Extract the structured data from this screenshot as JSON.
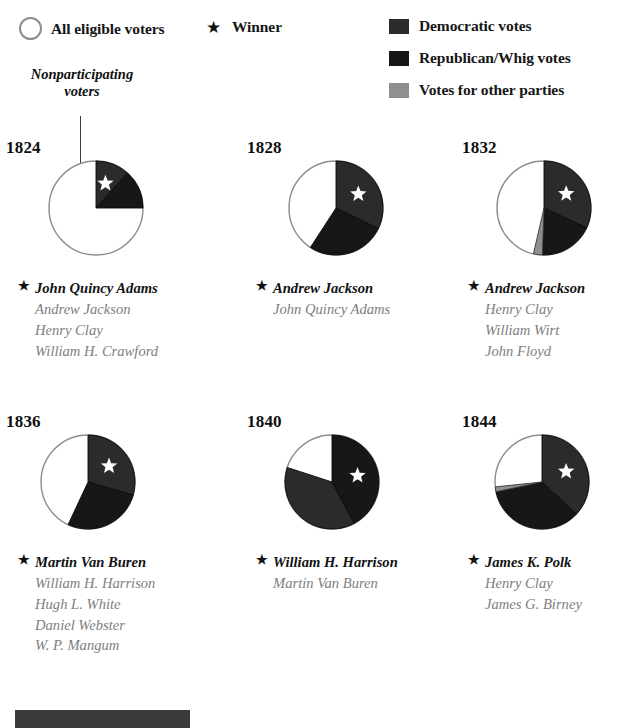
{
  "legend": {
    "all_voters": {
      "label": "All eligible voters",
      "icon": "open-circle-icon"
    },
    "winner": {
      "label": "Winner",
      "icon": "star-icon"
    },
    "democratic": {
      "label": "Democratic votes",
      "color": "#2b2b2b"
    },
    "republican": {
      "label": "Republican/Whig votes",
      "color": "#171717"
    },
    "other": {
      "label": "Votes for other parties",
      "color": "#8f8f8f"
    }
  },
  "callout": {
    "line1": "Nonparticipating",
    "line2": "voters"
  },
  "colors": {
    "democratic": "#2b2b2b",
    "republican": "#171717",
    "other": "#8f8f8f",
    "nonparticipating": "#ffffff",
    "outline": "#8d8d8d",
    "star": "#ffffff"
  },
  "chart_data": [
    {
      "type": "pie",
      "title": "1824",
      "winner": "John Quincy Adams",
      "slices": [
        {
          "name": "John Quincy Adams",
          "party": "democratic",
          "start_angle": 0,
          "end_angle": 42,
          "winner": true
        },
        {
          "name": "Andrew Jackson",
          "party": "republican",
          "start_angle": 42,
          "end_angle": 90,
          "winner": false
        },
        {
          "name": "Nonparticipating voters",
          "party": "nonparticipating",
          "start_angle": 90,
          "end_angle": 360,
          "winner": false
        }
      ],
      "candidates": [
        {
          "name": "John Quincy Adams",
          "winner": true
        },
        {
          "name": "Andrew Jackson",
          "winner": false
        },
        {
          "name": "Henry Clay",
          "winner": false
        },
        {
          "name": "William H. Crawford",
          "winner": false
        }
      ]
    },
    {
      "type": "pie",
      "title": "1828",
      "winner": "Andrew Jackson",
      "slices": [
        {
          "name": "Andrew Jackson",
          "party": "democratic",
          "start_angle": 0,
          "end_angle": 116,
          "winner": true
        },
        {
          "name": "John Quincy Adams",
          "party": "republican",
          "start_angle": 116,
          "end_angle": 213,
          "winner": false
        },
        {
          "name": "Nonparticipating voters",
          "party": "nonparticipating",
          "start_angle": 213,
          "end_angle": 360,
          "winner": false
        }
      ],
      "candidates": [
        {
          "name": "Andrew Jackson",
          "winner": true
        },
        {
          "name": "John Quincy Adams",
          "winner": false
        }
      ]
    },
    {
      "type": "pie",
      "title": "1832",
      "winner": "Andrew Jackson",
      "slices": [
        {
          "name": "Andrew Jackson",
          "party": "democratic",
          "start_angle": 0,
          "end_angle": 115,
          "winner": true
        },
        {
          "name": "Henry Clay",
          "party": "republican",
          "start_angle": 115,
          "end_angle": 182,
          "winner": false
        },
        {
          "name": "Other parties",
          "party": "other",
          "start_angle": 182,
          "end_angle": 193,
          "winner": false
        },
        {
          "name": "Nonparticipating voters",
          "party": "nonparticipating",
          "start_angle": 193,
          "end_angle": 360,
          "winner": false
        }
      ],
      "candidates": [
        {
          "name": "Andrew Jackson",
          "winner": true
        },
        {
          "name": "Henry Clay",
          "winner": false
        },
        {
          "name": "William Wirt",
          "winner": false
        },
        {
          "name": "John Floyd",
          "winner": false
        }
      ]
    },
    {
      "type": "pie",
      "title": "1836",
      "winner": "Martin Van Buren",
      "slices": [
        {
          "name": "Martin Van Buren",
          "party": "democratic",
          "start_angle": 0,
          "end_angle": 106,
          "winner": true
        },
        {
          "name": "William H. Harrison",
          "party": "republican",
          "start_angle": 106,
          "end_angle": 205,
          "winner": false
        },
        {
          "name": "Nonparticipating voters",
          "party": "nonparticipating",
          "start_angle": 205,
          "end_angle": 360,
          "winner": false
        }
      ],
      "candidates": [
        {
          "name": "Martin Van Buren",
          "winner": true
        },
        {
          "name": "William H. Harrison",
          "winner": false
        },
        {
          "name": "Hugh L. White",
          "winner": false
        },
        {
          "name": "Daniel Webster",
          "winner": false
        },
        {
          "name": "W. P. Mangum",
          "winner": false
        }
      ]
    },
    {
      "type": "pie",
      "title": "1840",
      "winner": "William H. Harrison",
      "slices": [
        {
          "name": "William H. Harrison",
          "party": "republican",
          "start_angle": 0,
          "end_angle": 152,
          "winner": true
        },
        {
          "name": "Martin Van Buren",
          "party": "democratic",
          "start_angle": 152,
          "end_angle": 288,
          "winner": false
        },
        {
          "name": "Nonparticipating voters",
          "party": "nonparticipating",
          "start_angle": 288,
          "end_angle": 360,
          "winner": false
        }
      ],
      "candidates": [
        {
          "name": "William H. Harrison",
          "winner": true
        },
        {
          "name": "Martin Van Buren",
          "winner": false
        }
      ]
    },
    {
      "type": "pie",
      "title": "1844",
      "winner": "James K. Polk",
      "slices": [
        {
          "name": "James K. Polk",
          "party": "democratic",
          "start_angle": 0,
          "end_angle": 133,
          "winner": true
        },
        {
          "name": "Henry Clay",
          "party": "republican",
          "start_angle": 133,
          "end_angle": 258,
          "winner": false
        },
        {
          "name": "James G. Birney",
          "party": "other",
          "start_angle": 258,
          "end_angle": 264,
          "winner": false
        },
        {
          "name": "Nonparticipating voters",
          "party": "nonparticipating",
          "start_angle": 264,
          "end_angle": 360,
          "winner": false
        }
      ],
      "candidates": [
        {
          "name": "James K. Polk",
          "winner": true
        },
        {
          "name": "Henry Clay",
          "winner": false
        },
        {
          "name": "James G. Birney",
          "winner": false
        }
      ]
    }
  ]
}
